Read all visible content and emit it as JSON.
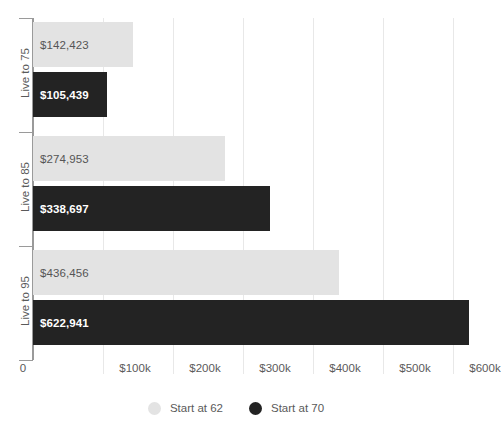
{
  "chart_data": {
    "type": "bar",
    "orientation": "horizontal",
    "title": "",
    "subtitle": "",
    "xlabel": "",
    "ylabel": "",
    "categories": [
      "Live to 75",
      "Live to 85",
      "Live to 95"
    ],
    "series": [
      {
        "name": "Start at 62",
        "color": "#e3e3e3",
        "values": [
          142423,
          274953,
          436456
        ],
        "labels": [
          "$142,423",
          "$274,953",
          "$436,456"
        ]
      },
      {
        "name": "Start at 70",
        "color": "#232323",
        "values": [
          105439,
          338697,
          622941
        ],
        "labels": [
          "$105,439",
          "$338,697",
          "$622,941"
        ]
      }
    ],
    "xlim": [
      0,
      640000
    ],
    "xticks": [
      0,
      100000,
      200000,
      300000,
      400000,
      500000,
      600000
    ],
    "xticklabels": [
      "0",
      "$100k",
      "$200k",
      "$300k",
      "$400k",
      "$500k",
      "$600k"
    ],
    "grid": true,
    "grid_axis": "x",
    "legend_position": "bottom"
  },
  "axis": {
    "y_tick_count": 4,
    "axis_color": "#9a9a9a",
    "grid_color": "#e8e8e8"
  },
  "legend": {
    "items": [
      {
        "label": "Start at 62",
        "marker": "circle-light",
        "color": "#e3e3e3"
      },
      {
        "label": "Start at 70",
        "marker": "circle-dark",
        "color": "#232323"
      }
    ]
  }
}
